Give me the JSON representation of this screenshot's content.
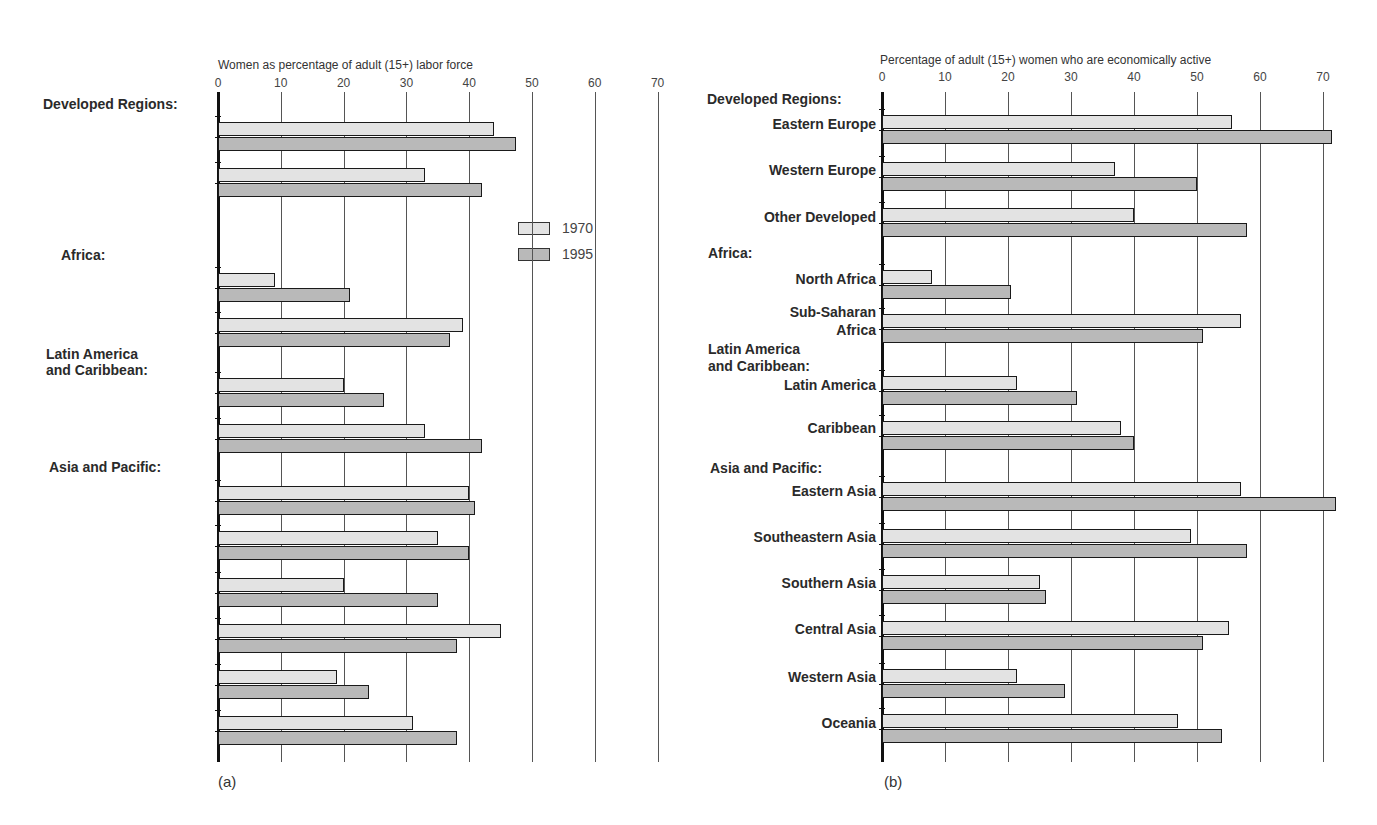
{
  "legend": [
    {
      "label": "1970",
      "color": "#e3e3e3"
    },
    {
      "label": "1995",
      "color": "#b9b9b9"
    }
  ],
  "panels": [
    {
      "tag": "(a)",
      "axis_title": "Women as percentage of adult (15+) labor force",
      "ticks": [
        "0",
        "10",
        "20",
        "30",
        "40",
        "50",
        "60",
        "70"
      ]
    },
    {
      "tag": "(b)",
      "axis_title": "Percentage of adult (15+) women who are economically active",
      "ticks": [
        "0",
        "10",
        "20",
        "30",
        "40",
        "50",
        "60",
        "70"
      ]
    }
  ],
  "chart_data": [
    {
      "type": "bar",
      "orientation": "horizontal",
      "title": "(a)",
      "xlabel": "Women as percentage of adult (15+) labor force",
      "xlim": [
        0,
        70
      ],
      "xticks": [
        0,
        10,
        20,
        30,
        40,
        50,
        60,
        70
      ],
      "grid": true,
      "legend_position": "inside right, near top",
      "groups": [
        {
          "label": "Developed Regions:",
          "categories": [
            "Eastern Europe",
            "Western Europe, Other Developed"
          ]
        },
        {
          "label": "Africa:",
          "categories": [
            "North Africa",
            "Sub-Saharan Africa"
          ]
        },
        {
          "label": "Latin America and Caribbean:",
          "categories": [
            "Latin America",
            "Caribbean"
          ]
        },
        {
          "label": "Asia and Pacific:",
          "categories": [
            "Eastern Asia",
            "Southeastern Asia",
            "Southern Asia",
            "Central Asia",
            "Western Asia",
            "Oceania"
          ]
        }
      ],
      "categories": [
        "Eastern Europe",
        "Western Europe, Other Developed",
        "North Africa",
        "Sub-Saharan Africa",
        "Latin America",
        "Caribbean",
        "Eastern Asia",
        "Southeastern Asia",
        "Southern Asia",
        "Central Asia",
        "Western Asia",
        "Oceania"
      ],
      "series": [
        {
          "name": "1970",
          "values": [
            44,
            33,
            9,
            39,
            20,
            33,
            40,
            35,
            20,
            45,
            19,
            31
          ]
        },
        {
          "name": "1995",
          "values": [
            47.5,
            42,
            21,
            37,
            26.5,
            42,
            41,
            40,
            35,
            38,
            24,
            38
          ]
        }
      ]
    },
    {
      "type": "bar",
      "orientation": "horizontal",
      "title": "(b)",
      "xlabel": "Percentage of adult (15+) women who are economically active",
      "xlim": [
        0,
        72
      ],
      "xticks": [
        0,
        10,
        20,
        30,
        40,
        50,
        60,
        70
      ],
      "grid": true,
      "groups": [
        {
          "label": "Developed Regions:",
          "categories": [
            "Eastern Europe",
            "Western Europe",
            "Other Developed"
          ]
        },
        {
          "label": "Africa:",
          "categories": [
            "North Africa",
            "Sub-Saharan Africa"
          ]
        },
        {
          "label": "Latin America and Caribbean:",
          "categories": [
            "Latin America",
            "Caribbean"
          ]
        },
        {
          "label": "Asia and Pacific:",
          "categories": [
            "Eastern Asia",
            "Southeastern Asia",
            "Southern Asia",
            "Central Asia",
            "Western Asia",
            "Oceania"
          ]
        }
      ],
      "categories": [
        "Eastern Europe",
        "Western Europe",
        "Other Developed",
        "North Africa",
        "Sub-Saharan Africa",
        "Latin America",
        "Caribbean",
        "Eastern Asia",
        "Southeastern Asia",
        "Southern Asia",
        "Central Asia",
        "Western Asia",
        "Oceania"
      ],
      "series": [
        {
          "name": "1970",
          "values": [
            55.5,
            37,
            40,
            8,
            57,
            21.5,
            38,
            57,
            49,
            25,
            55,
            21.5,
            47
          ]
        },
        {
          "name": "1995",
          "values": [
            71.5,
            50,
            58,
            20.5,
            51,
            31,
            40,
            72,
            58,
            26,
            51,
            29,
            54
          ]
        }
      ]
    }
  ],
  "layout": [
    {
      "x0": 218,
      "scale": 6.28,
      "grid_top": 92,
      "grid_bottom": 762,
      "title_x": 218,
      "title_y": 58,
      "tick_y": 76,
      "tag_x": 218,
      "tag_y": 773,
      "rows": [
        {
          "y": 122,
          "labels": [
            {
              "text": "Eastern Europe",
              "y": 130
            }
          ]
        },
        {
          "y": 168,
          "labels": [
            {
              "text": "Western Europe,",
              "y": 166
            },
            {
              "text": "Other Developed",
              "y": 184
            }
          ]
        },
        {
          "y": 273,
          "labels": [
            {
              "text": "North Africa",
              "y": 281
            }
          ]
        },
        {
          "y": 318,
          "labels": [
            {
              "text": "Sub-Saharan",
              "y": 315
            },
            {
              "text": "Africa",
              "y": 333
            }
          ]
        },
        {
          "y": 378,
          "labels": [
            {
              "text": "Latin America",
              "y": 390
            }
          ]
        },
        {
          "y": 424,
          "labels": [
            {
              "text": "Caribbean",
              "y": 431
            }
          ]
        },
        {
          "y": 486,
          "labels": [
            {
              "text": "Eastern Asia",
              "y": 494
            }
          ]
        },
        {
          "y": 531,
          "labels": [
            {
              "text": "Southeastern Asia",
              "y": 540
            }
          ]
        },
        {
          "y": 578,
          "labels": [
            {
              "text": "Southern Asia",
              "y": 585
            }
          ]
        },
        {
          "y": 624,
          "labels": [
            {
              "text": "Central Asia",
              "y": 632
            }
          ]
        },
        {
          "y": 670,
          "labels": [
            {
              "text": "Western Asia",
              "y": 678
            }
          ]
        },
        {
          "y": 716,
          "labels": [
            {
              "text": "Oceania",
              "y": 725
            }
          ]
        }
      ],
      "headers": [
        {
          "text": "Developed Regions:",
          "x": 43,
          "y": 104
        },
        {
          "text": "Africa:",
          "x": 61,
          "y": 255
        },
        {
          "text": "Latin America",
          "x": 46,
          "y": 354
        },
        {
          "text": "and Caribbean:",
          "x": 46,
          "y": 370
        },
        {
          "text": "Asia and Pacific:",
          "x": 49,
          "y": 467
        }
      ],
      "legend_x": 518,
      "legend_y": 222
    },
    {
      "x0": 882,
      "scale": 6.3,
      "grid_top": 92,
      "grid_bottom": 762,
      "title_x": 880,
      "title_y": 53,
      "tick_y": 70,
      "tag_x": 884,
      "tag_y": 773,
      "rows": [
        {
          "y": 115,
          "labels": [
            {
              "text": "Eastern Europe",
              "y": 124
            }
          ]
        },
        {
          "y": 162,
          "labels": [
            {
              "text": "Western Europe",
              "y": 170
            }
          ]
        },
        {
          "y": 208,
          "labels": [
            {
              "text": "Other Developed",
              "y": 217
            }
          ]
        },
        {
          "y": 270,
          "labels": [
            {
              "text": "North Africa",
              "y": 279
            }
          ]
        },
        {
          "y": 314,
          "labels": [
            {
              "text": "Sub-Saharan",
              "y": 312
            },
            {
              "text": "Africa",
              "y": 330
            }
          ]
        },
        {
          "y": 376,
          "labels": [
            {
              "text": "Latin America",
              "y": 385
            }
          ]
        },
        {
          "y": 421,
          "labels": [
            {
              "text": "Caribbean",
              "y": 428
            }
          ]
        },
        {
          "y": 482,
          "labels": [
            {
              "text": "Eastern Asia",
              "y": 491
            }
          ]
        },
        {
          "y": 529,
          "labels": [
            {
              "text": "Southeastern Asia",
              "y": 537
            }
          ]
        },
        {
          "y": 575,
          "labels": [
            {
              "text": "Southern Asia",
              "y": 583
            }
          ]
        },
        {
          "y": 621,
          "labels": [
            {
              "text": "Central Asia",
              "y": 629
            }
          ]
        },
        {
          "y": 669,
          "labels": [
            {
              "text": "Western Asia",
              "y": 677
            }
          ]
        },
        {
          "y": 714,
          "labels": [
            {
              "text": "Oceania",
              "y": 723
            }
          ]
        }
      ],
      "headers": [
        {
          "text": "Developed Regions:",
          "x": 707,
          "y": 99
        },
        {
          "text": "Africa:",
          "x": 708,
          "y": 253
        },
        {
          "text": "Latin America",
          "x": 708,
          "y": 349
        },
        {
          "text": "and Caribbean:",
          "x": 708,
          "y": 366
        },
        {
          "text": "Asia and Pacific:",
          "x": 710,
          "y": 468
        }
      ]
    }
  ]
}
